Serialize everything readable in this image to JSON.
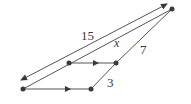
{
  "diagram": {
    "type": "geometry-figure",
    "colors": {
      "line": "#555555",
      "point": "#3a3a3a",
      "text": "#3a3a3a",
      "background": "#ffffff"
    },
    "points": [
      {
        "id": "A",
        "x": 23,
        "y": 89
      },
      {
        "id": "B",
        "x": 69,
        "y": 63
      },
      {
        "id": "C",
        "x": 116,
        "y": 63
      },
      {
        "id": "D",
        "x": 91,
        "y": 89
      },
      {
        "id": "E",
        "x": 172,
        "y": 9
      }
    ],
    "segments": [
      {
        "from": "A",
        "to": "D",
        "arrow": "mid"
      },
      {
        "from": "B",
        "to": "C",
        "arrow": "mid"
      },
      {
        "from": "D",
        "to": "C"
      },
      {
        "from": "A",
        "to": "E"
      },
      {
        "from": "C",
        "to": "E"
      }
    ],
    "dimension_line": {
      "x1": 19,
      "y1": 81,
      "x2": 168,
      "y2": 3,
      "arrows": "both",
      "label": "15"
    },
    "labels": [
      {
        "name": "length-15",
        "text": "15",
        "x": 81,
        "y": 40
      },
      {
        "name": "length-x",
        "text": "x",
        "x": 114,
        "y": 47
      },
      {
        "name": "length-7",
        "text": "7",
        "x": 140,
        "y": 54
      },
      {
        "name": "length-3",
        "text": "3",
        "x": 107,
        "y": 87
      }
    ]
  }
}
